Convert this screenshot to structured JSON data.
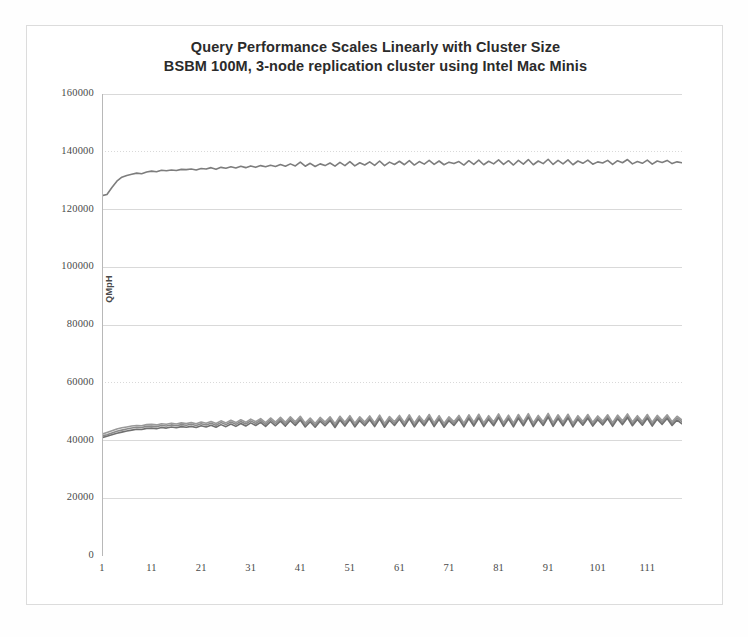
{
  "chart_data": {
    "type": "line",
    "title": "Query Performance Scales Linearly with Cluster Size",
    "subtitle": "BSBM 100M, 3-node replication cluster using Intel Mac Minis",
    "xlabel": "",
    "ylabel": "QMpH",
    "ylim": [
      0,
      160000
    ],
    "ytick_labels": [
      "160000",
      "140000",
      "120000",
      "100000",
      "80000",
      "60000",
      "40000",
      "20000",
      "0"
    ],
    "ytick_values": [
      160000,
      140000,
      120000,
      100000,
      80000,
      60000,
      40000,
      20000,
      0
    ],
    "xlim": [
      1,
      118
    ],
    "xtick_labels": [
      "1",
      "11",
      "21",
      "31",
      "41",
      "51",
      "61",
      "71",
      "81",
      "91",
      "101",
      "111"
    ],
    "xtick_values": [
      1,
      11,
      21,
      31,
      41,
      51,
      61,
      71,
      81,
      91,
      101,
      111
    ],
    "grid": true,
    "legend": "none",
    "colors": {
      "series_cluster": "#7d7d7d",
      "series_node_a": "#8a8a8a",
      "series_node_b": "#9a9a9a",
      "series_node_c": "#707070",
      "gridline": "#d9d9d9",
      "axis": "#b8b8b8",
      "frame": "#dcdcdc",
      "text": "#4a4a4a"
    },
    "x": [
      1,
      2,
      3,
      4,
      5,
      6,
      7,
      8,
      9,
      10,
      11,
      12,
      13,
      14,
      15,
      16,
      17,
      18,
      19,
      20,
      21,
      22,
      23,
      24,
      25,
      26,
      27,
      28,
      29,
      30,
      31,
      32,
      33,
      34,
      35,
      36,
      37,
      38,
      39,
      40,
      41,
      42,
      43,
      44,
      45,
      46,
      47,
      48,
      49,
      50,
      51,
      52,
      53,
      54,
      55,
      56,
      57,
      58,
      59,
      60,
      61,
      62,
      63,
      64,
      65,
      66,
      67,
      68,
      69,
      70,
      71,
      72,
      73,
      74,
      75,
      76,
      77,
      78,
      79,
      80,
      81,
      82,
      83,
      84,
      85,
      86,
      87,
      88,
      89,
      90,
      91,
      92,
      93,
      94,
      95,
      96,
      97,
      98,
      99,
      100,
      101,
      102,
      103,
      104,
      105,
      106,
      107,
      108,
      109,
      110,
      111,
      112,
      113,
      114,
      115,
      116,
      117,
      118
    ],
    "series": [
      {
        "name": "Cluster total (3 nodes)",
        "color": "#7d7d7d",
        "values": [
          124800,
          125200,
          127600,
          129800,
          131200,
          131800,
          132200,
          132600,
          132400,
          133000,
          133300,
          133100,
          133600,
          133400,
          133700,
          133500,
          133900,
          133800,
          134000,
          133700,
          134200,
          134000,
          134500,
          133900,
          134600,
          134300,
          134800,
          134400,
          135000,
          134500,
          135100,
          134600,
          135200,
          134800,
          135300,
          134900,
          135600,
          135000,
          135800,
          135100,
          136400,
          135000,
          136000,
          134900,
          135800,
          135200,
          136100,
          135000,
          136300,
          135200,
          136600,
          135100,
          136200,
          135400,
          136500,
          135300,
          136800,
          135200,
          136400,
          135600,
          136700,
          135500,
          136900,
          135400,
          136600,
          135700,
          137000,
          135600,
          136800,
          135500,
          136400,
          135900,
          136600,
          135400,
          136900,
          135600,
          137100,
          135500,
          136700,
          135800,
          137200,
          135600,
          136900,
          135400,
          137000,
          135700,
          137300,
          135500,
          136800,
          135900,
          137400,
          135600,
          137000,
          135800,
          137200,
          135500,
          136800,
          136000,
          137100,
          135700,
          136500,
          136100,
          137000,
          135600,
          136900,
          136200,
          137300,
          135800,
          136600,
          136000,
          137100,
          135700,
          136800,
          136300,
          137000,
          135900,
          136500,
          136200
        ]
      },
      {
        "name": "Node 1",
        "color": "#8a8a8a",
        "values": [
          41600,
          42000,
          42600,
          43200,
          43600,
          44000,
          44300,
          44600,
          44500,
          44900,
          45000,
          44800,
          45200,
          45000,
          45400,
          45100,
          45500,
          45300,
          45600,
          45200,
          45800,
          45400,
          46000,
          45300,
          46200,
          45500,
          46400,
          45600,
          46600,
          45700,
          46800,
          45900,
          47000,
          45600,
          47200,
          45800,
          47400,
          45700,
          47600,
          45900,
          47800,
          45400,
          47200,
          45300,
          47400,
          45800,
          47600,
          45200,
          47800,
          45700,
          48000,
          45400,
          47600,
          45800,
          47900,
          45500,
          48200,
          45300,
          47700,
          45900,
          48100,
          45600,
          48300,
          45400,
          47900,
          45800,
          48400,
          45500,
          48000,
          45300,
          47600,
          45900,
          48100,
          45400,
          48300,
          45700,
          48500,
          45500,
          48000,
          45800,
          48600,
          45600,
          48200,
          45400,
          48400,
          45800,
          48700,
          45500,
          48100,
          45900,
          48800,
          45600,
          48300,
          45800,
          48500,
          45400,
          48000,
          46000,
          48400,
          45700,
          47900,
          46100,
          48300,
          45600,
          48200,
          46200,
          48600,
          45800,
          48000,
          46000,
          48400,
          45700,
          48100,
          46300,
          48300,
          45900,
          47800,
          46500
        ]
      },
      {
        "name": "Node 2",
        "color": "#9a9a9a",
        "values": [
          42200,
          42800,
          43400,
          44000,
          44400,
          44700,
          45000,
          45200,
          45100,
          45500,
          45600,
          45400,
          45800,
          45600,
          46000,
          45700,
          46100,
          45900,
          46200,
          45800,
          46400,
          46000,
          46600,
          45900,
          46800,
          46100,
          47000,
          46200,
          47200,
          46300,
          47400,
          46500,
          47600,
          46200,
          47800,
          46400,
          48000,
          46300,
          48200,
          46500,
          48400,
          46000,
          47800,
          45900,
          48000,
          46400,
          48200,
          45800,
          48400,
          46300,
          48600,
          46000,
          48200,
          46400,
          48500,
          46100,
          48800,
          45900,
          48300,
          46500,
          48700,
          46200,
          48900,
          46000,
          48500,
          46400,
          49000,
          46100,
          48600,
          45900,
          48200,
          46500,
          48700,
          46000,
          48900,
          46300,
          49100,
          46100,
          48600,
          46400,
          49200,
          46200,
          48800,
          46000,
          49000,
          46400,
          49300,
          46100,
          48700,
          46500,
          49400,
          46200,
          48900,
          46400,
          49100,
          46000,
          48600,
          46600,
          49000,
          46300,
          48500,
          46700,
          48900,
          46200,
          48800,
          46800,
          49200,
          46400,
          48600,
          46600,
          49000,
          46300,
          48700,
          46900,
          48900,
          46500,
          48400,
          47100
        ]
      },
      {
        "name": "Node 3",
        "color": "#707070",
        "values": [
          41000,
          41500,
          42000,
          42500,
          42900,
          43300,
          43600,
          43900,
          43800,
          44200,
          44300,
          44100,
          44500,
          44300,
          44700,
          44400,
          44800,
          44600,
          44900,
          44500,
          45100,
          44700,
          45300,
          44600,
          45500,
          44800,
          45700,
          44900,
          45900,
          45000,
          46100,
          45200,
          46300,
          44900,
          46500,
          45100,
          46700,
          45000,
          46900,
          45200,
          47100,
          44700,
          46500,
          44600,
          46700,
          45100,
          46900,
          44500,
          47100,
          45000,
          47300,
          44700,
          46900,
          45100,
          47200,
          44800,
          47500,
          44600,
          47000,
          45200,
          47400,
          44900,
          47600,
          44700,
          47200,
          45100,
          47700,
          44800,
          47300,
          44600,
          46900,
          45200,
          47400,
          44700,
          47600,
          45000,
          47800,
          44800,
          47300,
          45100,
          47900,
          44900,
          47500,
          44700,
          47700,
          45100,
          48000,
          44800,
          47400,
          45200,
          48100,
          44900,
          47600,
          45100,
          47800,
          44700,
          47300,
          45300,
          47700,
          45000,
          47200,
          45400,
          47600,
          44900,
          47500,
          45500,
          47900,
          45100,
          47300,
          45300,
          47700,
          45000,
          47400,
          45600,
          47600,
          45200,
          47100,
          45800
        ]
      }
    ]
  }
}
